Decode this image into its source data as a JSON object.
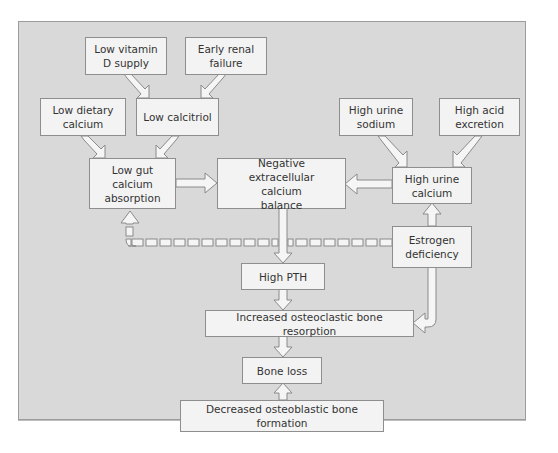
{
  "diagram": {
    "type": "flowchart",
    "title": "",
    "colors": {
      "panel": "#d9d9d9",
      "box": "#f3f3f3",
      "border": "#8e8e8e",
      "arrow_fill": "#f5f5f5",
      "text": "#333333"
    },
    "nodes": {
      "low_vitamin_d": "Low vitamin D supply",
      "early_renal_failure": "Early renal failure",
      "low_dietary_calcium": "Low dietary calcium",
      "low_calcitriol": "Low calcitriol",
      "low_gut_absorption": "Low gut calcium absorption",
      "negative_balance": "Negative extracellular calcium balance",
      "high_urine_sodium": "High urine sodium",
      "high_acid_excretion": "High acid excretion",
      "high_urine_calcium": "High urine calcium",
      "estrogen_deficiency": "Estrogen deficiency",
      "high_pth": "High PTH",
      "increased_resorption": "Increased osteoclastic bone resorption",
      "bone_loss": "Bone loss",
      "decreased_formation": "Decreased osteoblastic bone formation"
    },
    "edges": [
      {
        "from": "Low vitamin D supply",
        "to": "Low calcitriol",
        "style": "solid"
      },
      {
        "from": "Early renal failure",
        "to": "Low calcitriol",
        "style": "solid"
      },
      {
        "from": "Low dietary calcium",
        "to": "Low gut calcium absorption",
        "style": "solid"
      },
      {
        "from": "Low calcitriol",
        "to": "Low gut calcium absorption",
        "style": "solid"
      },
      {
        "from": "Low gut calcium absorption",
        "to": "Negative extracellular calcium balance",
        "style": "solid"
      },
      {
        "from": "High urine sodium",
        "to": "High urine calcium",
        "style": "solid"
      },
      {
        "from": "High acid excretion",
        "to": "High urine calcium",
        "style": "solid"
      },
      {
        "from": "High urine calcium",
        "to": "Negative extracellular calcium balance",
        "style": "solid"
      },
      {
        "from": "Estrogen deficiency",
        "to": "High urine calcium",
        "style": "solid"
      },
      {
        "from": "Estrogen deficiency",
        "to": "Low gut calcium absorption",
        "style": "dashed"
      },
      {
        "from": "Estrogen deficiency",
        "to": "Increased osteoclastic bone resorption",
        "style": "solid"
      },
      {
        "from": "Negative extracellular calcium balance",
        "to": "High PTH",
        "style": "solid"
      },
      {
        "from": "High PTH",
        "to": "Increased osteoclastic bone resorption",
        "style": "solid"
      },
      {
        "from": "Increased osteoclastic bone resorption",
        "to": "Bone loss",
        "style": "solid"
      },
      {
        "from": "Decreased osteoblastic bone formation",
        "to": "Bone loss",
        "style": "solid"
      }
    ]
  }
}
